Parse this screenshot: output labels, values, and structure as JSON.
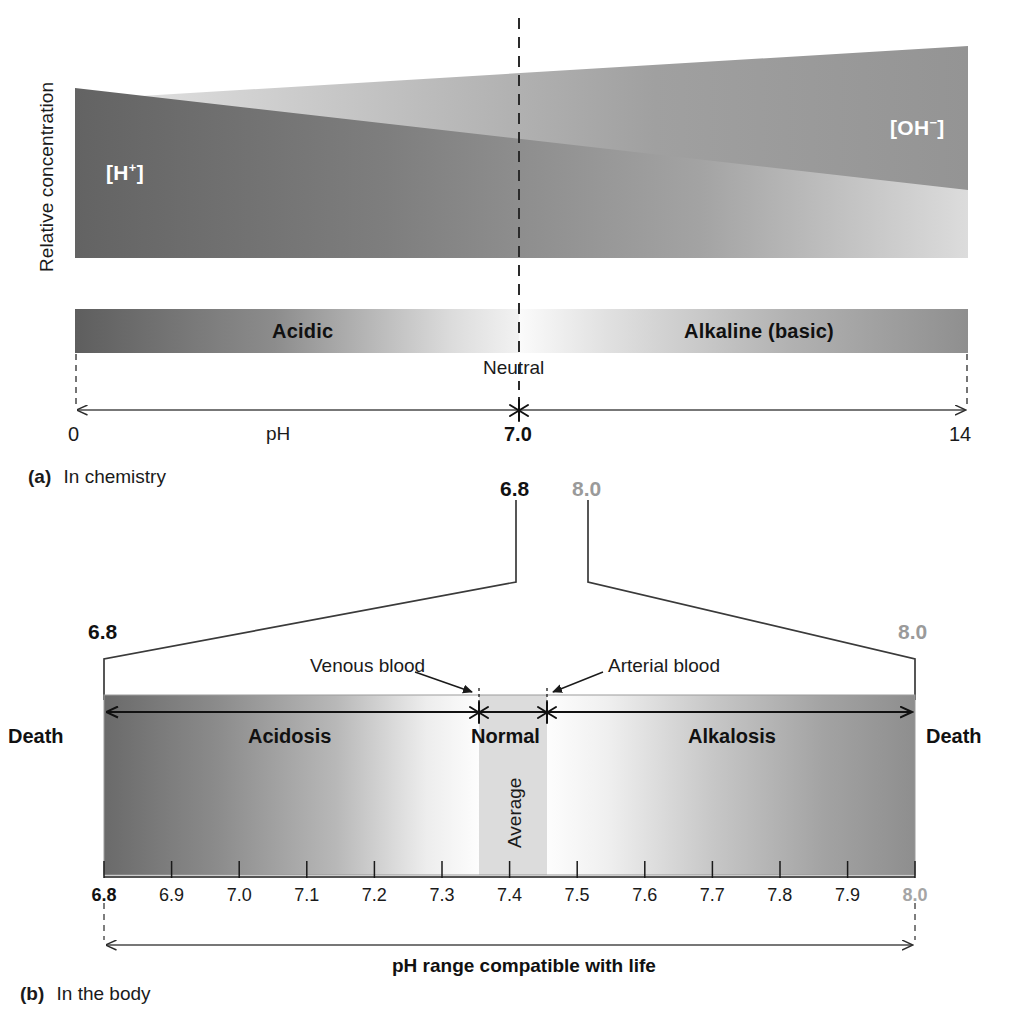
{
  "figure": {
    "panel_a": {
      "caption_marker": "(a)",
      "caption_text": "In chemistry",
      "y_axis_label": "Relative concentration",
      "wedge_hplus": "[H+]",
      "wedge_hplus_base": "[H",
      "wedge_hplus_sup": "+",
      "wedge_hplus_tail": "]",
      "wedge_ohminus_base": "[OH",
      "wedge_ohminus_sup": "−",
      "wedge_ohminus_tail": "]",
      "band_acidic": "Acidic",
      "band_alkaline": "Alkaline (basic)",
      "neutral_label": "Neutral",
      "axis_name": "pH",
      "axis_min": "0",
      "axis_mid": "7.0",
      "axis_max": "14"
    },
    "callout": {
      "top_left_value": "6.8",
      "top_right_value": "8.0",
      "bottom_left_value": "6.8",
      "bottom_right_value": "8.0"
    },
    "panel_b": {
      "caption_marker": "(b)",
      "caption_text": "In the body",
      "annotation_venous": "Venous blood",
      "annotation_arterial": "Arterial blood",
      "death_left": "Death",
      "death_right": "Death",
      "zone_acidosis": "Acidosis",
      "zone_normal": "Normal",
      "zone_alkalosis": "Alkalosis",
      "average_label": "Average",
      "range_label": "pH range compatible with life"
    }
  },
  "chart_data": {
    "type": "area",
    "panels": [
      {
        "id": "a",
        "label": "(a) In chemistry",
        "xlabel": "pH",
        "ylabel": "Relative concentration",
        "xlim": [
          0,
          14
        ],
        "xticks": [
          "0",
          "7.0",
          "14"
        ],
        "neutral_point": 7.0,
        "grid": false,
        "series": [
          {
            "name": "[H+]",
            "description": "Hydrogen ion relative concentration wedge, high at pH 0 decreasing to low at pH 14",
            "x": [
              0,
              14
            ],
            "values": [
              1.0,
              0.0
            ]
          },
          {
            "name": "[OH-]",
            "description": "Hydroxide ion relative concentration wedge, low at pH 0 increasing to high at pH 14",
            "x": [
              0,
              14
            ],
            "values": [
              0.0,
              1.0
            ]
          }
        ],
        "regions": [
          {
            "name": "Acidic",
            "from": 0,
            "to": 7.0
          },
          {
            "name": "Alkaline (basic)",
            "from": 7.0,
            "to": 14
          }
        ],
        "annotations": [
          {
            "text": "Neutral",
            "at": 7.0
          }
        ]
      },
      {
        "id": "b",
        "label": "(b) In the body",
        "xlabel": "pH",
        "xlim": [
          6.8,
          8.0
        ],
        "xticks": [
          "6.8",
          "6.9",
          "7.0",
          "7.1",
          "7.2",
          "7.3",
          "7.4",
          "7.5",
          "7.6",
          "7.7",
          "7.8",
          "7.9",
          "8.0"
        ],
        "grid": false,
        "regions": [
          {
            "name": "Acidosis",
            "from": 6.8,
            "to": 7.35
          },
          {
            "name": "Normal",
            "from": 7.35,
            "to": 7.45
          },
          {
            "name": "Alkalosis",
            "from": 7.45,
            "to": 8.0
          }
        ],
        "markers": [
          {
            "name": "Venous blood",
            "at": 7.35
          },
          {
            "name": "Arterial blood",
            "at": 7.45
          }
        ],
        "endpoints": [
          {
            "name": "Death",
            "at": 6.8
          },
          {
            "name": "Death",
            "at": 8.0
          }
        ],
        "span_annotation": {
          "text": "pH range compatible with life",
          "from": 6.8,
          "to": 8.0
        }
      }
    ]
  },
  "ticks_panel_b": [
    {
      "value": "6.8",
      "style": "bold-dark"
    },
    {
      "value": "6.9",
      "style": "plain"
    },
    {
      "value": "7.0",
      "style": "plain"
    },
    {
      "value": "7.1",
      "style": "plain"
    },
    {
      "value": "7.2",
      "style": "plain"
    },
    {
      "value": "7.3",
      "style": "plain"
    },
    {
      "value": "7.4",
      "style": "plain"
    },
    {
      "value": "7.5",
      "style": "plain"
    },
    {
      "value": "7.6",
      "style": "plain"
    },
    {
      "value": "7.7",
      "style": "plain"
    },
    {
      "value": "7.8",
      "style": "plain"
    },
    {
      "value": "7.9",
      "style": "plain"
    },
    {
      "value": "8.0",
      "style": "bold-gray"
    }
  ],
  "colors": {
    "ink": "#1a1a1a",
    "gray_number": "#9a9a9a",
    "wedge_dark": "#6f6f6f",
    "wedge_light": "#efefef",
    "band_dark": "#707070",
    "band_light": "#f4f4f4",
    "normal_band": "#dcdcdc",
    "page_bg": "#ffffff"
  }
}
